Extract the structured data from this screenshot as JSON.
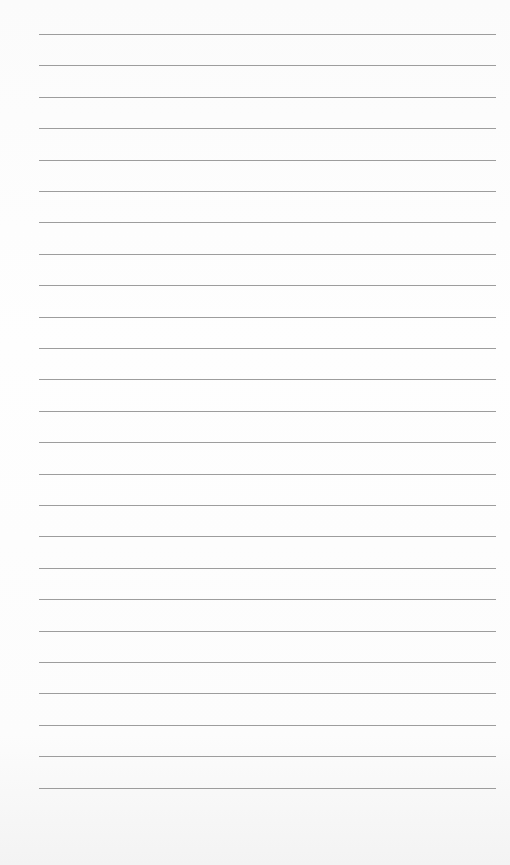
{
  "document": {
    "type": "lined-paper",
    "line_count": 25,
    "line_color": "#8c8c8c",
    "background_color": "#fdfdfd",
    "first_line_y": 34,
    "line_spacing": 31.4,
    "line_left": 39,
    "line_right": 496
  }
}
